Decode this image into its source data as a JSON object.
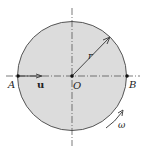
{
  "diagram": {
    "type": "rotating-disk",
    "colors": {
      "disk_fill": "#dcdcdc",
      "disk_stroke": "#555555",
      "line": "#444444",
      "point": "#111111",
      "background": "#ffffff"
    },
    "labels": {
      "point_a": "A",
      "point_b": "B",
      "center": "O",
      "velocity": "u",
      "radius": "r",
      "angular_velocity": "ω"
    }
  }
}
